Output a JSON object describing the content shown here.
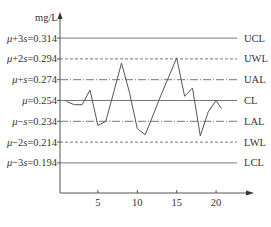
{
  "chart_data": {
    "type": "line",
    "title": "",
    "xlabel": "",
    "ylabel": "mg/L",
    "x_ticks": [
      5,
      10,
      15,
      20
    ],
    "xlim": [
      0,
      25
    ],
    "ylim": [
      0.165,
      0.33
    ],
    "grid": false,
    "legend": null,
    "control_lines": [
      {
        "label_left": "μ+3s=0.314",
        "prefix": "μ",
        "suffix_op": "+3",
        "sym": "s",
        "value_text": "=0.314",
        "value": 0.314,
        "label_right": "UCL",
        "style": "solid"
      },
      {
        "label_left": "μ+2s=0.294",
        "prefix": "μ",
        "suffix_op": "+2",
        "sym": "s",
        "value_text": "=0.294",
        "value": 0.294,
        "label_right": "UWL",
        "style": "dashed"
      },
      {
        "label_left": "μ+s=0.274",
        "prefix": "μ",
        "suffix_op": "+",
        "sym": "s",
        "value_text": "=0.274",
        "value": 0.274,
        "label_right": "UAL",
        "style": "dashdot"
      },
      {
        "label_left": "μ=0.254",
        "prefix": "μ",
        "suffix_op": "",
        "sym": "",
        "value_text": "=0.254",
        "value": 0.254,
        "label_right": "CL",
        "style": "solid"
      },
      {
        "label_left": "μ-s=0.234",
        "prefix": "μ",
        "suffix_op": "−",
        "sym": "s",
        "value_text": "=0.234",
        "value": 0.234,
        "label_right": "LAL",
        "style": "dashdot"
      },
      {
        "label_left": "μ-2s=0.214",
        "prefix": "μ",
        "suffix_op": "−2",
        "sym": "s",
        "value_text": "=0.214",
        "value": 0.214,
        "label_right": "LWL",
        "style": "dashed"
      },
      {
        "label_left": "μ-3s=0.194",
        "prefix": "μ",
        "suffix_op": "−3",
        "sym": "s",
        "value_text": "=0.194",
        "value": 0.194,
        "label_right": "LCL",
        "style": "solid"
      }
    ],
    "series": [
      {
        "name": "measurements",
        "x": [
          1,
          2,
          3,
          4,
          5,
          6,
          7,
          8,
          9,
          10,
          11,
          12,
          13,
          14,
          15,
          16,
          17,
          18,
          19,
          20,
          20.7
        ],
        "values": [
          0.253,
          0.25,
          0.25,
          0.264,
          0.23,
          0.234,
          0.262,
          0.29,
          0.262,
          0.227,
          0.221,
          0.24,
          0.259,
          0.277,
          0.295,
          0.258,
          0.266,
          0.22,
          0.243,
          0.254,
          0.246
        ]
      }
    ]
  }
}
